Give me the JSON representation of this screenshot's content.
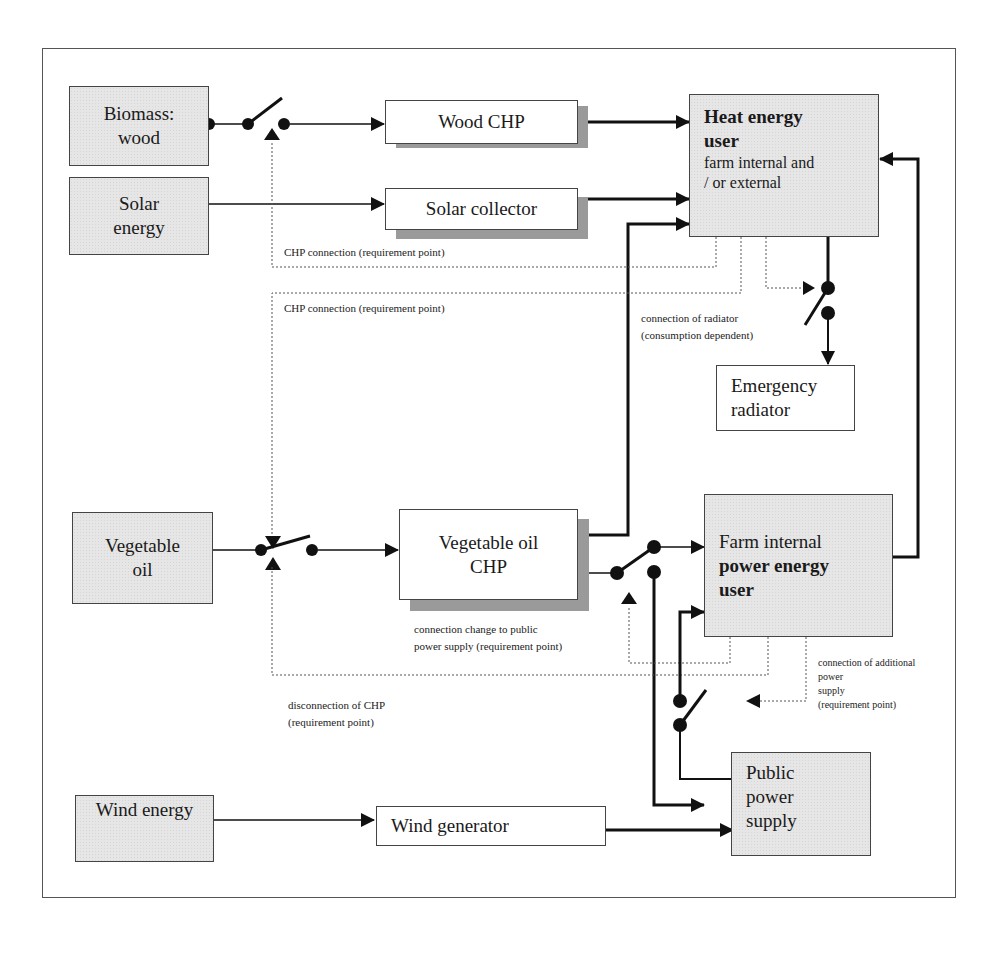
{
  "diagram": {
    "title_fragment": "",
    "sources": {
      "biomass": {
        "line1": "Biomass:",
        "line2": "wood"
      },
      "solar": {
        "line1": "Solar",
        "line2": "energy"
      },
      "vegetable_oil": {
        "line1": "Vegetable",
        "line2": "oil"
      },
      "wind": {
        "line1": "Wind energy"
      }
    },
    "converters": {
      "wood_chp": "Wood CHP",
      "solar_collector": "Solar collector",
      "veg_oil_chp": {
        "line1": "Vegetable oil",
        "line2": "CHP"
      },
      "wind_generator": "Wind generator"
    },
    "users": {
      "heat_user": {
        "title1": "Heat energy",
        "title2": "user",
        "sub1": "farm internal and",
        "sub2": "/ or external"
      },
      "emergency_radiator": {
        "line1": "Emergency",
        "line2": "radiator"
      },
      "power_user": {
        "line1": "Farm internal",
        "line2": "power energy",
        "line3": "user"
      },
      "public_power": {
        "line1": "Public",
        "line2": "power",
        "line3": "supply"
      }
    },
    "annotations": {
      "chp_connection_1": "CHP connection  (requirement point)",
      "chp_connection_2": "CHP connection  (requirement point)",
      "radiator_1": "connection of radiator",
      "radiator_2": "(consumption dependent)",
      "public_change_1": "connection change to public",
      "public_change_2": "power supply  (requirement point)",
      "disconnection_1": "disconnection   of CHP",
      "disconnection_2": "(requirement point)",
      "additional_1": "connection   of additional",
      "additional_2": "power",
      "additional_3": "supply",
      "additional_4": "(requirement point)"
    },
    "colors": {
      "source_fill": "#e6e6e6",
      "shadow": "#9a9a9a",
      "line": "#111111",
      "frame": "#555555"
    }
  }
}
